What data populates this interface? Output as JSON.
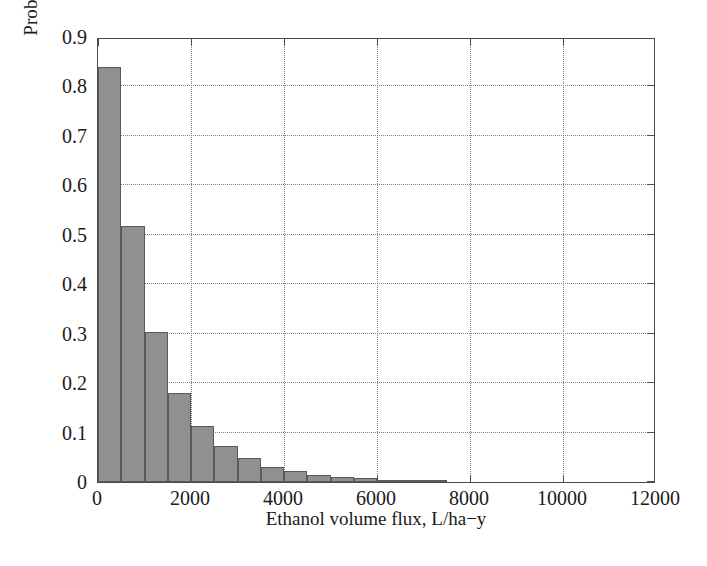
{
  "chart_data": {
    "type": "bar",
    "title": "",
    "xlabel": "Ethanol volume flux, L/ha−y",
    "ylabel": "Prob(Flux>Abscissa)",
    "xlim": [
      0,
      12000
    ],
    "ylim": [
      0,
      0.9
    ],
    "grid": true,
    "legend": null,
    "xticks": [
      0,
      2000,
      4000,
      6000,
      8000,
      10000,
      12000
    ],
    "xtick_labels": [
      "0",
      "2000",
      "4000",
      "6000",
      "8000",
      "10000",
      "12000"
    ],
    "yticks": [
      0,
      0.1,
      0.2,
      0.3,
      0.4,
      0.5,
      0.6,
      0.7,
      0.8,
      0.9
    ],
    "ytick_labels": [
      "0",
      "0.1",
      "0.2",
      "0.3",
      "0.4",
      "0.5",
      "0.6",
      "0.7",
      "0.8",
      "0.9"
    ],
    "bar_width": 500,
    "bar_color": "#909090",
    "bar_edge_color": "#5a5a5a",
    "x": [
      250,
      750,
      1250,
      1750,
      2250,
      2750,
      3250,
      3750,
      4250,
      4750,
      5250,
      5750,
      6250,
      6750,
      7250
    ],
    "categories": [
      "0–500",
      "500–1000",
      "1000–1500",
      "1500–2000",
      "2000–2500",
      "2500–3000",
      "3000–3500",
      "3500–4000",
      "4000–4500",
      "4500–5000",
      "5000–5500",
      "5500–6000",
      "6000–6500",
      "6500–7000",
      "7000–7500"
    ],
    "values": [
      0.84,
      0.518,
      0.303,
      0.18,
      0.113,
      0.072,
      0.048,
      0.031,
      0.022,
      0.014,
      0.011,
      0.008,
      0.005,
      0.003,
      0.002
    ]
  },
  "figure": {
    "caption_remnant": "",
    "axis_color": "#4a4a4a",
    "grid_color": "#7d7d7d",
    "background": "#ffffff"
  }
}
